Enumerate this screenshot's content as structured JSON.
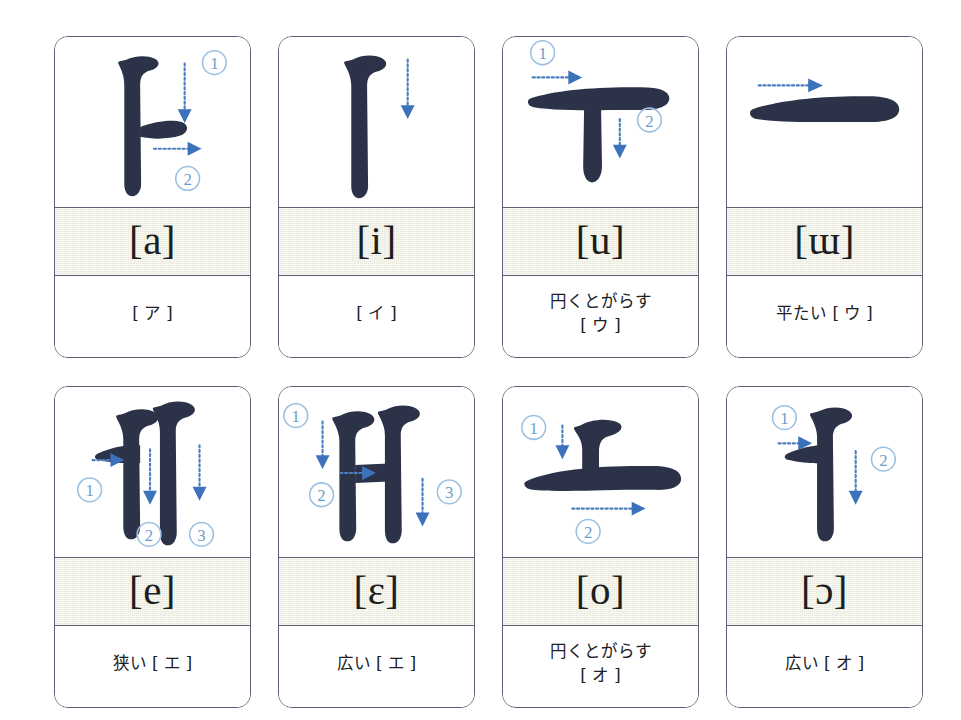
{
  "page": {
    "background": "#ffffff",
    "stroke_color": "#2c3349",
    "guide_color": "#3c72bb",
    "number_color": "#6d9ecb",
    "band_color": "#e8e8dd",
    "border_color": "#5b6172",
    "rows": 2,
    "columns": 4
  },
  "cards": [
    {
      "id": "card-a",
      "jamo": "ㅏ",
      "ipa": "[a]",
      "note": "[ ア ]",
      "stroke_count": 2,
      "stroke_numbers": [
        "①",
        "②"
      ],
      "numbers": [
        "1",
        "2"
      ]
    },
    {
      "id": "card-i",
      "jamo": "ㅣ",
      "ipa": "[i]",
      "note": "[ イ ]",
      "stroke_count": 1,
      "stroke_numbers": [],
      "numbers": []
    },
    {
      "id": "card-u",
      "jamo": "ㅜ",
      "ipa": "[u]",
      "note": "円くとがらす\n[ ウ ]",
      "stroke_count": 2,
      "stroke_numbers": [
        "①",
        "②"
      ],
      "numbers": [
        "1",
        "2"
      ]
    },
    {
      "id": "card-eu",
      "jamo": "ㅡ",
      "ipa": "[ɯ]",
      "note": "平たい [ ウ ]",
      "stroke_count": 1,
      "stroke_numbers": [],
      "numbers": []
    },
    {
      "id": "card-e",
      "jamo": "ㅔ",
      "ipa": "[e]",
      "note": "狭い [ エ ]",
      "stroke_count": 3,
      "stroke_numbers": [
        "①",
        "②",
        "③"
      ],
      "numbers": [
        "1",
        "2",
        "3"
      ]
    },
    {
      "id": "card-ae",
      "jamo": "ㅐ",
      "ipa": "[ɛ]",
      "note": "広い [ エ ]",
      "stroke_count": 3,
      "stroke_numbers": [
        "①",
        "②",
        "③"
      ],
      "numbers": [
        "1",
        "2",
        "3"
      ]
    },
    {
      "id": "card-o",
      "jamo": "ㅗ",
      "ipa": "[o]",
      "note": "円くとがらす\n[ オ ]",
      "stroke_count": 2,
      "stroke_numbers": [
        "①",
        "②"
      ],
      "numbers": [
        "1",
        "2"
      ]
    },
    {
      "id": "card-eo",
      "jamo": "ㅓ",
      "ipa": "[ɔ]",
      "note": "広い [ オ ]",
      "stroke_count": 2,
      "stroke_numbers": [
        "①",
        "②"
      ],
      "numbers": [
        "1",
        "2"
      ]
    }
  ]
}
